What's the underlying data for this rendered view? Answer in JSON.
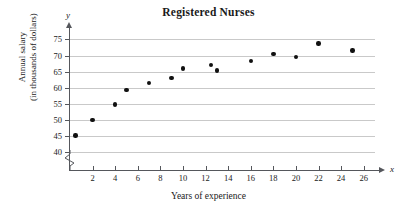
{
  "chart_data": {
    "type": "scatter",
    "title": "Registered Nurses",
    "xlabel": "Years of experience",
    "ylabel_line1": "Annual salary",
    "ylabel_line2": "(in thousands of dollars)",
    "x_axis_letter": "x",
    "y_axis_letter": "y",
    "xlim": [
      0,
      27
    ],
    "ylim": [
      38.5,
      77
    ],
    "y_axis_break": true,
    "y_axis_break_note": "zigzag break below 40",
    "grid": "horizontal",
    "legend": "none",
    "xticks": [
      2,
      4,
      6,
      8,
      10,
      12,
      14,
      16,
      18,
      20,
      22,
      24,
      26
    ],
    "yticks": [
      40,
      45,
      50,
      55,
      60,
      65,
      70,
      75
    ],
    "point_color": "#111111",
    "grid_color": "#c9c9c9",
    "axis_color": "#55575c",
    "points": [
      {
        "x": 0.5,
        "y": 45.2
      },
      {
        "x": 2,
        "y": 50.0
      },
      {
        "x": 4,
        "y": 54.8
      },
      {
        "x": 5,
        "y": 59.3
      },
      {
        "x": 7,
        "y": 61.4
      },
      {
        "x": 9,
        "y": 63.0
      },
      {
        "x": 10,
        "y": 66.0
      },
      {
        "x": 12.5,
        "y": 67.1
      },
      {
        "x": 13,
        "y": 65.3
      },
      {
        "x": 16,
        "y": 68.3
      },
      {
        "x": 18,
        "y": 70.5
      },
      {
        "x": 20,
        "y": 69.5
      },
      {
        "x": 22,
        "y": 73.8
      },
      {
        "x": 25,
        "y": 71.6
      }
    ]
  }
}
